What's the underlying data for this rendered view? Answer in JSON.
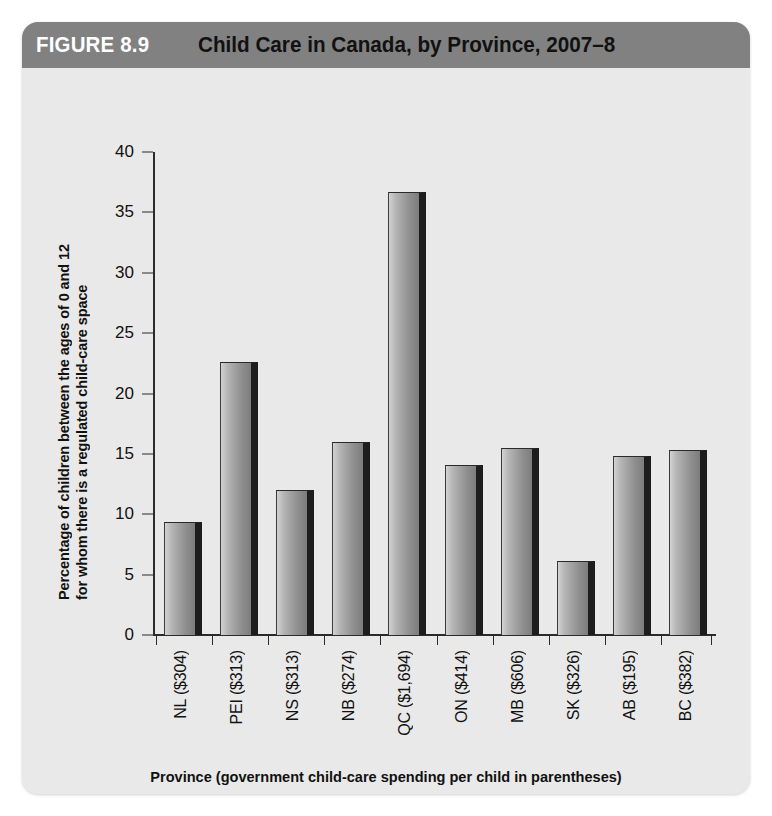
{
  "figure": {
    "number": "FIGURE 8.9",
    "title": "Child Care in Canada, by Province, 2007–8",
    "header_bg": "#818181",
    "panel_bg": "#e9e9e9"
  },
  "chart_data": {
    "type": "bar",
    "title": "Child Care in Canada, by Province, 2007–8",
    "xlabel": "Province (government child-care spending per child in parentheses)",
    "ylabel": "Percentage of children between the ages of 0 and 12 for whom there is a regulated child-care space",
    "ylabel_line1": "Percentage of children between the ages of 0 and 12",
    "ylabel_line2": "for whom there is a regulated child-care space",
    "categories": [
      "NL ($304)",
      "PEI ($313)",
      "NS ($313)",
      "NB ($274)",
      "QC ($1,694)",
      "ON ($414)",
      "MB ($606)",
      "SK ($326)",
      "AB ($195)",
      "BC ($382)"
    ],
    "province_codes": [
      "NL",
      "PEI",
      "NS",
      "NB",
      "QC",
      "ON",
      "MB",
      "SK",
      "AB",
      "BC"
    ],
    "spending_per_child": [
      304,
      313,
      313,
      274,
      1694,
      414,
      606,
      326,
      195,
      382
    ],
    "values": [
      9.4,
      22.6,
      12.0,
      16.0,
      36.7,
      14.1,
      15.5,
      6.1,
      14.8,
      15.3
    ],
    "ylim": [
      0,
      40
    ],
    "yticks": [
      0,
      5,
      10,
      15,
      20,
      25,
      30,
      35,
      40
    ],
    "ytick_labels": [
      "0",
      "5",
      "10",
      "15",
      "20",
      "25",
      "30",
      "35",
      "40"
    ],
    "grid": false,
    "legend": false,
    "bar_color": "#9a9a9a",
    "bar_shadow_color": "#1d1d1d",
    "axis_color": "#2b2b2b"
  }
}
